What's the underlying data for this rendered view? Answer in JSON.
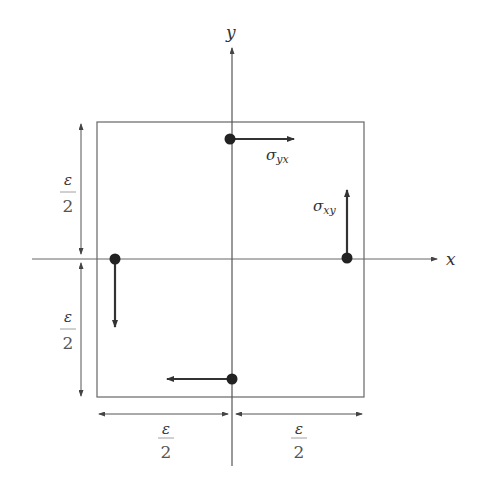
{
  "diagram": {
    "type": "stress-element",
    "axes": {
      "x_label": "x",
      "y_label": "y"
    },
    "element_box": {
      "x1": 97,
      "y1": 122,
      "x2": 364,
      "y2": 397
    },
    "origin": {
      "x": 232,
      "y": 259
    },
    "stress_labels": {
      "top": "σ",
      "top_sub": "yx",
      "right": "σ",
      "right_sub": "xy"
    },
    "stress_points": [
      {
        "name": "top",
        "x": 230,
        "y": 139,
        "direction": "right"
      },
      {
        "name": "right",
        "x": 347,
        "y": 258,
        "direction": "up"
      },
      {
        "name": "left",
        "x": 115,
        "y": 259,
        "direction": "down"
      },
      {
        "name": "bottom",
        "x": 232,
        "y": 379,
        "direction": "left"
      }
    ],
    "dimensions": {
      "upper_left": {
        "numerator": "ε",
        "denominator": "2"
      },
      "lower_left": {
        "numerator": "ε",
        "denominator": "2"
      },
      "bottom_left": {
        "numerator": "ε",
        "denominator": "2"
      },
      "bottom_right": {
        "numerator": "ε",
        "denominator": "2"
      }
    },
    "colors": {
      "line": "#555555",
      "arrow": "#333333",
      "dot": "#222222"
    }
  }
}
